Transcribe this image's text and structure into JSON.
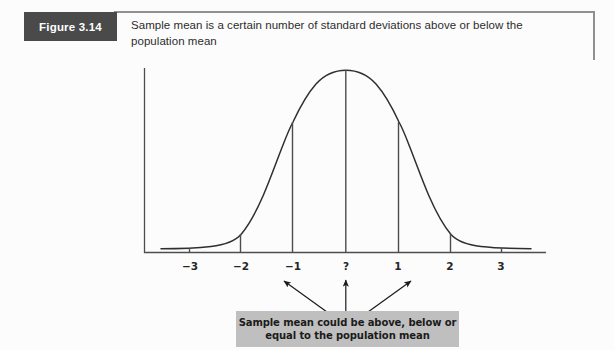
{
  "figure": {
    "badge_label": "Figure 3.14",
    "caption": "Sample mean is a certain number of standard deviations above or below the population mean"
  },
  "callout": {
    "text": "Sample mean could be above, below or\nequal to the population mean"
  },
  "colors": {
    "badge_background": "#4a4a4a",
    "badge_text": "#ffffff",
    "rule": "#8e9094",
    "curve": "#2f2f2f",
    "axis": "#4d4d4d",
    "callout_background": "#bfbfbf",
    "callout_text": "#1b1b1b",
    "page_background": "#fcfcfc"
  },
  "chart_data": {
    "type": "line",
    "title": "",
    "subtitle": "",
    "xlabel": "",
    "ylabel": "",
    "grid": false,
    "legend": null,
    "xlim": [
      -3.8,
      3.8
    ],
    "ylim": [
      0,
      1
    ],
    "tick_labels": [
      "−3",
      "−2",
      "−1",
      "?",
      "1",
      "2",
      "3"
    ],
    "tick_values": [
      -3,
      -2,
      -1,
      0,
      1,
      2,
      3
    ],
    "tick_pixel_x": [
      190,
      241,
      293,
      346,
      398,
      450,
      501
    ],
    "marker_lines": [
      {
        "label": "−2",
        "x": -2,
        "height_fraction": 0.105
      },
      {
        "label": "−1",
        "x": -1,
        "height_fraction": 0.607
      },
      {
        "label": "?",
        "x": 0,
        "height_fraction": 1.0
      },
      {
        "label": "1",
        "x": 1,
        "height_fraction": 0.607
      },
      {
        "label": "2",
        "x": 2,
        "height_fraction": 0.105
      }
    ],
    "x": [
      -3.8,
      -3.5,
      -3.0,
      -2.5,
      -2.0,
      -1.5,
      -1.0,
      -0.5,
      0.0,
      0.5,
      1.0,
      1.5,
      2.0,
      2.5,
      3.0,
      3.5,
      3.8
    ],
    "y": [
      0.0008,
      0.0022,
      0.011,
      0.044,
      0.135,
      0.325,
      0.607,
      0.882,
      1.0,
      0.882,
      0.607,
      0.325,
      0.135,
      0.044,
      0.011,
      0.0022,
      0.0008
    ],
    "annotations": [
      {
        "name": "center-label",
        "text": "?",
        "x": 0
      },
      {
        "name": "callout",
        "text": "Sample mean could be above, below or equal to the population mean",
        "arrow_targets": [
          -1,
          0,
          1
        ]
      }
    ]
  }
}
